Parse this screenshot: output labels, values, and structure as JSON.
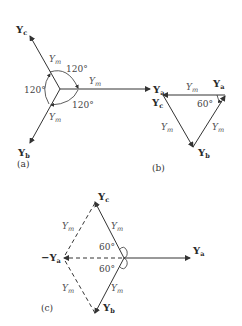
{
  "figure": {
    "panels": [
      {
        "id": "a",
        "caption": "(a)",
        "vectors": [
          {
            "name": "Y",
            "sub": "a",
            "magnitude_label": "Y",
            "magnitude_sub": "m"
          },
          {
            "name": "Y",
            "sub": "b",
            "magnitude_label": "Y",
            "magnitude_sub": "m"
          },
          {
            "name": "Y",
            "sub": "c",
            "magnitude_label": "Y",
            "magnitude_sub": "m"
          }
        ],
        "angles": [
          "120°",
          "120°",
          "120°"
        ]
      },
      {
        "id": "b",
        "caption": "(b)",
        "vertices": [
          {
            "name": "Y",
            "sub": "a"
          },
          {
            "name": "Y",
            "sub": "b"
          },
          {
            "name": "Y",
            "sub": "c"
          }
        ],
        "sides": [
          "Y_m",
          "Y_m",
          "Y_m"
        ],
        "angle": "60°"
      },
      {
        "id": "c",
        "caption": "(c)",
        "vectors": [
          {
            "name": "Y",
            "sub": "a"
          },
          {
            "name": "Y",
            "sub": "b"
          },
          {
            "name": "Y",
            "sub": "c"
          },
          {
            "name": "−Y",
            "sub": "a"
          }
        ],
        "magnitude_labels": [
          "Y_m",
          "Y_m",
          "Y_m",
          "Y_m"
        ],
        "angles": [
          "60°",
          "60°"
        ]
      }
    ],
    "text": {
      "Y": "Y",
      "negY": "−Y",
      "a": "a",
      "b": "b",
      "c": "c",
      "m": "m",
      "deg120": "120°",
      "deg60": "60°",
      "cap_a": "(a)",
      "cap_b": "(b)",
      "cap_c": "(c)"
    }
  }
}
